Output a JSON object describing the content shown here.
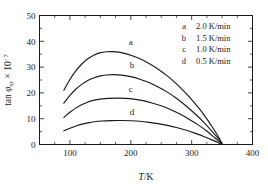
{
  "chart_data": {
    "type": "line",
    "title": "",
    "xlabel": "T/K",
    "ylabel": "tan φxy × 10⁻⁷",
    "ylabel_parts": {
      "lead": "tan ",
      "phi": "φ",
      "sub": "xy",
      "times": " × 10",
      "sup": "−7"
    },
    "xlim": [
      50,
      400
    ],
    "ylim": [
      0,
      50
    ],
    "xticks": [
      100,
      200,
      300,
      400
    ],
    "xtick_labels": [
      "100",
      "200",
      "300",
      "400"
    ],
    "yticks": [
      0,
      10,
      20,
      30,
      40,
      50
    ],
    "ytick_labels": [
      "0",
      "10",
      "20",
      "30",
      "40",
      "50"
    ],
    "x_minor_step": 25,
    "y_minor_step": 5,
    "grid": false,
    "legend_position": "top-right",
    "convergence_point": {
      "x": 350,
      "y": 0
    },
    "series": [
      {
        "name": "a",
        "legend_key": "a",
        "legend_value": "2.0 K/min",
        "label": "a",
        "label_x": 200,
        "label_y": 38.5,
        "peak": {
          "x": 165,
          "y": 36.0
        },
        "points": [
          [
            90,
            21.0
          ],
          [
            100,
            25.2
          ],
          [
            110,
            28.6
          ],
          [
            120,
            31.3
          ],
          [
            130,
            33.3
          ],
          [
            140,
            34.7
          ],
          [
            150,
            35.6
          ],
          [
            160,
            35.95
          ],
          [
            170,
            36.0
          ],
          [
            180,
            35.8
          ],
          [
            190,
            35.3
          ],
          [
            200,
            34.6
          ],
          [
            215,
            33.2
          ],
          [
            230,
            31.4
          ],
          [
            245,
            29.2
          ],
          [
            260,
            26.6
          ],
          [
            275,
            23.5
          ],
          [
            290,
            20.0
          ],
          [
            305,
            16.0
          ],
          [
            320,
            11.6
          ],
          [
            335,
            6.4
          ],
          [
            345,
            2.6
          ],
          [
            350,
            0
          ]
        ]
      },
      {
        "name": "b",
        "legend_key": "b",
        "legend_value": "1.5 K/min",
        "label": "b",
        "label_x": 202,
        "label_y": 29.5,
        "peak": {
          "x": 172,
          "y": 27.1
        },
        "points": [
          [
            90,
            16.0
          ],
          [
            100,
            19.0
          ],
          [
            110,
            21.5
          ],
          [
            120,
            23.4
          ],
          [
            130,
            24.9
          ],
          [
            140,
            25.9
          ],
          [
            150,
            26.6
          ],
          [
            160,
            26.95
          ],
          [
            172,
            27.1
          ],
          [
            185,
            26.9
          ],
          [
            200,
            26.3
          ],
          [
            215,
            25.3
          ],
          [
            230,
            24.0
          ],
          [
            245,
            22.3
          ],
          [
            260,
            20.3
          ],
          [
            275,
            17.9
          ],
          [
            290,
            15.1
          ],
          [
            305,
            12.0
          ],
          [
            320,
            8.6
          ],
          [
            335,
            4.7
          ],
          [
            345,
            1.9
          ],
          [
            350,
            0
          ]
        ]
      },
      {
        "name": "c",
        "legend_key": "c",
        "legend_value": "1.0 K/min",
        "label": "c",
        "label_x": 200,
        "label_y": 20.5,
        "peak": {
          "x": 178,
          "y": 18.0
        },
        "points": [
          [
            90,
            10.5
          ],
          [
            100,
            12.5
          ],
          [
            110,
            14.2
          ],
          [
            120,
            15.5
          ],
          [
            130,
            16.5
          ],
          [
            140,
            17.2
          ],
          [
            150,
            17.6
          ],
          [
            163,
            17.9
          ],
          [
            178,
            18.0
          ],
          [
            192,
            17.9
          ],
          [
            205,
            17.6
          ],
          [
            220,
            17.0
          ],
          [
            235,
            16.1
          ],
          [
            250,
            15.0
          ],
          [
            265,
            13.6
          ],
          [
            280,
            11.9
          ],
          [
            295,
            9.9
          ],
          [
            310,
            7.7
          ],
          [
            325,
            5.2
          ],
          [
            338,
            2.6
          ],
          [
            346,
            1.0
          ],
          [
            350,
            0
          ]
        ]
      },
      {
        "name": "d",
        "legend_key": "d",
        "legend_value": "0.5 K/min",
        "label": "d",
        "label_x": 202,
        "label_y": 11.6,
        "peak": {
          "x": 185,
          "y": 9.3
        },
        "points": [
          [
            90,
            5.3
          ],
          [
            100,
            6.3
          ],
          [
            110,
            7.2
          ],
          [
            120,
            7.9
          ],
          [
            130,
            8.4
          ],
          [
            140,
            8.8
          ],
          [
            152,
            9.1
          ],
          [
            168,
            9.25
          ],
          [
            185,
            9.3
          ],
          [
            200,
            9.2
          ],
          [
            215,
            9.0
          ],
          [
            230,
            8.6
          ],
          [
            245,
            8.1
          ],
          [
            260,
            7.4
          ],
          [
            275,
            6.6
          ],
          [
            290,
            5.6
          ],
          [
            305,
            4.4
          ],
          [
            320,
            3.1
          ],
          [
            333,
            1.8
          ],
          [
            343,
            0.8
          ],
          [
            350,
            0
          ]
        ]
      }
    ]
  },
  "legend": {
    "rows": [
      {
        "key": "a",
        "value": "2.0 K/min"
      },
      {
        "key": "b",
        "value": "1.5 K/min"
      },
      {
        "key": "c",
        "value": "1.0 K/min"
      },
      {
        "key": "d",
        "value": "0.5 K/min"
      }
    ]
  }
}
